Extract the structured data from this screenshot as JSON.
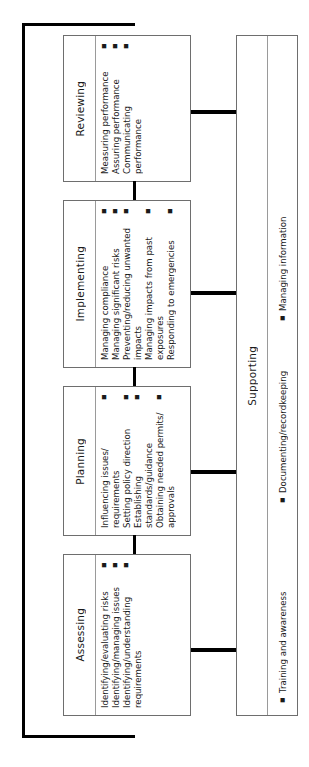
{
  "diagram": {
    "frame": {
      "name": "feedback-loop",
      "color": "#000000"
    },
    "stages": [
      {
        "id": "reviewing",
        "label": "Reviewing",
        "items": [
          "Measuring performance",
          "Assuring performance",
          "Communicating performance"
        ]
      },
      {
        "id": "implementing",
        "label": "Implementing",
        "items": [
          "Managing compliance",
          "Managing significant risks",
          "Preventing/reducing unwanted impacts",
          "Managing impacts from past exposures",
          "Responding to emergencies"
        ]
      },
      {
        "id": "planning",
        "label": "Planning",
        "items": [
          "Influencing issues/ requirements",
          "Setting policy direction",
          "Establishing standards/guidance",
          "Obtaining needed permits/ approvals"
        ]
      },
      {
        "id": "assessing",
        "label": "Assessing",
        "items": [
          "Identifying/evaluating risks",
          "Identifying/managing issues",
          "Identifying/understanding requirements"
        ]
      }
    ],
    "supporting": {
      "id": "supporting",
      "label": "Supporting",
      "items": [
        "Training and awareness",
        "Documenting/recordkeeping",
        "Managing information"
      ]
    },
    "bullet_glyph": "▪"
  }
}
